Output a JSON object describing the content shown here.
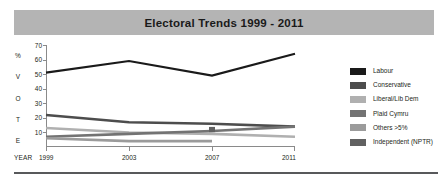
{
  "title": {
    "text": "Electoral Trends 1999 - 2011"
  },
  "axes": {
    "y_axis_title_letters": [
      "%",
      "V",
      "O",
      "T",
      "E"
    ],
    "x_axis_name": "YEAR"
  },
  "legend": {
    "position": "right",
    "items": [
      {
        "label": "Labour",
        "color": "#1a1a1a"
      },
      {
        "label": "Conservative",
        "color": "#4d4d4d"
      },
      {
        "label": "Liberal/Lib Dem",
        "color": "#b0b0b0"
      },
      {
        "label": "Plaid Cymru",
        "color": "#737373"
      },
      {
        "label": "Others >5%",
        "color": "#9b9b9b"
      },
      {
        "label": "Independent (NPTR)",
        "color": "#616161"
      }
    ]
  },
  "chart_data": {
    "type": "line",
    "title": "Electoral Trends 1999 - 2011",
    "xlabel": "YEAR",
    "ylabel": "% VOTE",
    "x": [
      "1999",
      "2003",
      "2007",
      "2011"
    ],
    "xticklabels": [
      "1999",
      "2003",
      "2007",
      "2011"
    ],
    "yticklabels": [
      "70",
      "60",
      "50",
      "40",
      "30",
      "20",
      "10"
    ],
    "yticks": [
      70,
      60,
      50,
      40,
      30,
      20,
      10
    ],
    "ylim": [
      0,
      70
    ],
    "grid": false,
    "legend_position": "right",
    "series": [
      {
        "name": "Labour",
        "color": "#1a1a1a",
        "values": [
          51,
          59,
          49,
          64
        ]
      },
      {
        "name": "Conservative",
        "color": "#4d4d4d",
        "values": [
          22,
          17,
          16,
          14
        ]
      },
      {
        "name": "Liberal/Lib Dem",
        "color": "#b0b0b0",
        "values": [
          13,
          10,
          9,
          7
        ]
      },
      {
        "name": "Plaid Cymru",
        "color": "#737373",
        "values": [
          7,
          9,
          11,
          14
        ]
      },
      {
        "name": "Others >5%",
        "color": "#9b9b9b",
        "values": [
          6,
          4,
          4,
          null
        ]
      },
      {
        "name": "Independent (NPTR)",
        "color": "#616161",
        "values": [
          null,
          null,
          12,
          null
        ]
      }
    ]
  }
}
